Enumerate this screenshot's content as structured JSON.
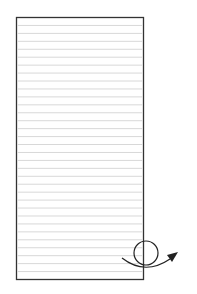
{
  "diagram": {
    "sheet": {
      "ruled_line_count": 32,
      "border_color": "#333333",
      "line_color": "#d8d8d8",
      "background": "#ffffff"
    },
    "gesture": {
      "type": "curl-arrow",
      "color": "#222222"
    }
  }
}
